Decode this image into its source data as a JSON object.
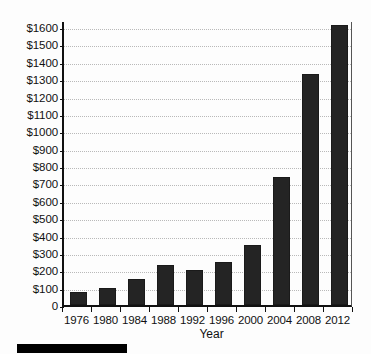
{
  "chart_data": {
    "type": "bar",
    "title": "",
    "subtitle": "",
    "xlabel": "Year",
    "ylabel": "",
    "categories": [
      "1976",
      "1980",
      "1984",
      "1988",
      "1992",
      "1996",
      "2000",
      "2004",
      "2008",
      "2012"
    ],
    "values": [
      75,
      100,
      150,
      230,
      200,
      250,
      345,
      735,
      1330,
      1610
    ],
    "value_prefix": "$",
    "ylim": [
      0,
      1600
    ],
    "ytick_values": [
      0,
      100,
      200,
      300,
      400,
      500,
      600,
      700,
      800,
      900,
      1000,
      1100,
      1200,
      1300,
      1400,
      1500,
      1600
    ],
    "ytick_labels": [
      "0",
      "$100",
      "$200",
      "$300",
      "$400",
      "$500",
      "$600",
      "$700",
      "$800",
      "$900",
      "$1000",
      "$1100",
      "$1200",
      "$1300",
      "$1400",
      "$1500",
      "$1600"
    ],
    "grid": true,
    "grid_axis": "y",
    "grid_style": "dotted",
    "legend": false,
    "legend_position": "none",
    "bar_color": "#242424",
    "grid_color": "#b9b9b9",
    "axis_color": "#111111",
    "background_color": "#fdfdfd"
  },
  "figure": {
    "caption_bar_present": true
  }
}
